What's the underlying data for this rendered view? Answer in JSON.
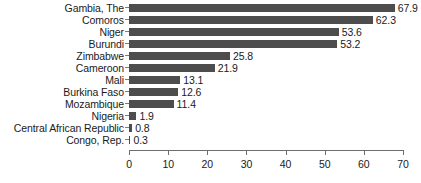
{
  "chart_data": {
    "type": "bar",
    "orientation": "horizontal",
    "title": "",
    "subtitle": "",
    "xlabel": "",
    "ylabel": "",
    "xlim": [
      0,
      70
    ],
    "xticks": [
      0,
      10,
      20,
      30,
      40,
      50,
      60,
      70
    ],
    "xtick_labels": [
      "0",
      "10",
      "20",
      "30",
      "40",
      "50",
      "60",
      "70"
    ],
    "grid": false,
    "legend": null,
    "bar_color": "#4d4d4d",
    "axis_color": "#6f6f6f",
    "text_color": "#1a1a1a",
    "categories": [
      "Gambia, The",
      "Comoros",
      "Niger",
      "Burundi",
      "Zimbabwe",
      "Cameroon",
      "Mali",
      "Burkina Faso",
      "Mozambique",
      "Nigeria",
      "Central African Republic",
      "Congo, Rep."
    ],
    "values": [
      67.9,
      62.3,
      53.6,
      53.2,
      25.8,
      21.9,
      13.1,
      12.6,
      11.4,
      1.9,
      0.8,
      0.3
    ],
    "value_labels": [
      "67.9",
      "62.3",
      "53.6",
      "53.2",
      "25.8",
      "21.9",
      "13.1",
      "12.6",
      "11.4",
      "1.9",
      "0.8",
      "0.3"
    ]
  }
}
